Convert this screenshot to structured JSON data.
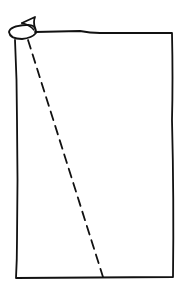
{
  "diagram": {
    "type": "hand-drawn sketch",
    "colors": {
      "background": "#ffffff",
      "stroke": "#111111"
    },
    "shapes": [
      {
        "kind": "rectangle",
        "name": "sheet-outline",
        "x1": 15,
        "y1": 33,
        "x2": 173,
        "y2": 278
      },
      {
        "kind": "curl",
        "name": "curled-corner",
        "cx": 22,
        "cy": 30
      },
      {
        "kind": "dashed-line",
        "name": "fold-line",
        "from": [
          28,
          38
        ],
        "to": [
          103,
          277
        ]
      }
    ]
  }
}
